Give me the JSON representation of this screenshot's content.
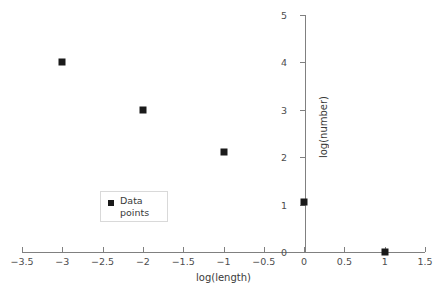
{
  "chart_data": {
    "type": "scatter",
    "title": "",
    "xlabel": "log(length)",
    "ylabel": "log(number)",
    "xlim": [
      -3.5,
      1.5
    ],
    "ylim": [
      0,
      5
    ],
    "xticks": [
      -3.5,
      -3,
      -2.5,
      -2,
      -1.5,
      -1,
      -0.5,
      0,
      0.5,
      1,
      1.5
    ],
    "xtick_labels": [
      "−3.5",
      "−3",
      "−2.5",
      "−2",
      "−1.5",
      "−1",
      "−0.5",
      "0",
      "0.5",
      "1",
      "1.5"
    ],
    "yticks": [
      0,
      1,
      2,
      3,
      4,
      5
    ],
    "ytick_labels": [
      "0",
      "1",
      "2",
      "3",
      "4",
      "5"
    ],
    "grid": false,
    "legend_position": "center-left",
    "series": [
      {
        "name": "Data points",
        "marker": "square",
        "color": "#1a1a1a",
        "points": [
          {
            "x": -3,
            "y": 4
          },
          {
            "x": -2,
            "y": 3
          },
          {
            "x": -1,
            "y": 2.1
          },
          {
            "x": 0,
            "y": 1.05
          },
          {
            "x": 1,
            "y": 0
          }
        ]
      }
    ]
  },
  "legend": {
    "line1": "Data",
    "line2": "points"
  },
  "colors": {
    "axis": "#808080",
    "marker": "#1a1a1a",
    "text": "#3a3a3a",
    "legend_border": "#d9d9d9",
    "background": "#ffffff"
  }
}
